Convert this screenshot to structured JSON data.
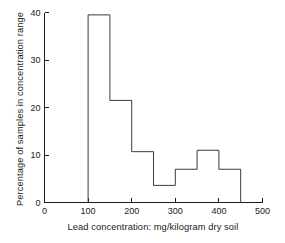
{
  "chart_data": {
    "type": "bar",
    "title": "",
    "subtitle": "",
    "xlabel": "Lead concentration: mg/kilogram dry soil",
    "ylabel": "Percentage of samples in concentration range",
    "xlim": [
      0,
      500
    ],
    "ylim": [
      0,
      40
    ],
    "xticks": [
      0,
      100,
      200,
      300,
      400,
      500
    ],
    "yticks": [
      0,
      10,
      20,
      30,
      40
    ],
    "xtick_labels": [
      "0",
      "100",
      "200",
      "300",
      "400",
      "500"
    ],
    "ytick_labels": [
      "0",
      "10",
      "20",
      "30",
      "40"
    ],
    "grid": false,
    "legend": false,
    "bin_width": 50,
    "bin_edges": [
      100,
      150,
      200,
      250,
      300,
      350,
      400,
      450
    ],
    "categories": [
      "100-150",
      "150-200",
      "200-250",
      "250-300",
      "300-350",
      "350-400",
      "400-450"
    ],
    "values": [
      39.5,
      21.5,
      10.7,
      3.6,
      7.0,
      11.0,
      7.0
    ],
    "line_color": "#3a3a3a",
    "fill_color": "none",
    "axis_color": "#1a1a1a"
  },
  "axes": {
    "y_title": "Percentage of samples in concentration range",
    "x_title": "Lead concentration: mg/kilogram dry soil"
  }
}
